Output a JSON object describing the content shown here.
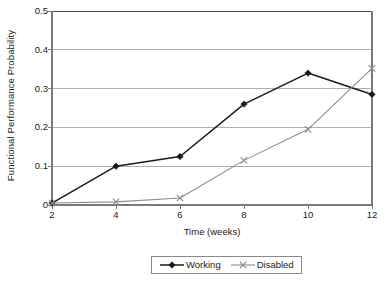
{
  "chart_data": {
    "type": "line",
    "title": "",
    "xlabel": "Time (weeks)",
    "ylabel": "Functional Performance Probability",
    "x": [
      2,
      4,
      6,
      8,
      10,
      12
    ],
    "xtick_labels": [
      "2",
      "4",
      "6",
      "8",
      "10",
      "12"
    ],
    "xlim": [
      2,
      12
    ],
    "ylim": [
      0,
      0.5
    ],
    "ytick_labels": [
      "0",
      "0.1",
      "0.2",
      "0.3",
      "0.4",
      "0.5"
    ],
    "ytick_values": [
      0,
      0.1,
      0.2,
      0.3,
      0.4,
      0.5
    ],
    "grid": "horizontal",
    "legend_position": "bottom-center",
    "series": [
      {
        "name": "Working",
        "marker": "diamond",
        "color": "#1a1a1a",
        "values": [
          0.005,
          0.1,
          0.125,
          0.26,
          0.34,
          0.285
        ]
      },
      {
        "name": "Disabled",
        "marker": "x",
        "color": "#8c8c8c",
        "values": [
          0.005,
          0.008,
          0.018,
          0.115,
          0.195,
          0.352
        ]
      }
    ]
  },
  "legend": {
    "entries": [
      {
        "label": "Working"
      },
      {
        "label": "Disabled"
      }
    ]
  },
  "colors": {
    "working": "#1a1a1a",
    "disabled": "#8c8c8c",
    "gridline": "#a6a6a6",
    "axis": "#7a7a7a",
    "background": "#ffffff"
  }
}
